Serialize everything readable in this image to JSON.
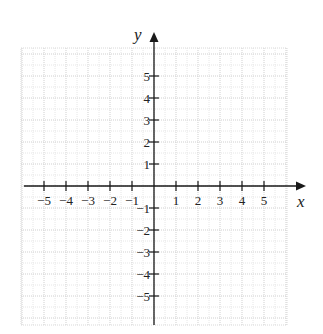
{
  "chart_data": {
    "type": "scatter",
    "title": "",
    "xlabel": "x",
    "ylabel": "y",
    "xlim": [
      -6,
      6
    ],
    "ylim": [
      -6,
      6
    ],
    "grid": true,
    "grid_style": "dotted",
    "x_ticks": [
      -5,
      -4,
      -3,
      -2,
      -1,
      1,
      2,
      3,
      4,
      5
    ],
    "y_ticks": [
      5,
      4,
      3,
      2,
      1,
      -1,
      -2,
      -3,
      -4,
      -5
    ],
    "x_tick_labels": [
      "−5",
      "−4",
      "−3",
      "−2",
      "−1",
      "1",
      "2",
      "3",
      "4",
      "5"
    ],
    "y_tick_labels": [
      "5",
      "4",
      "3",
      "2",
      "1",
      "−1",
      "−2",
      "−3",
      "−4",
      "−5"
    ],
    "series": [],
    "legend": null
  },
  "colors": {
    "axis": "#1a1a1a",
    "grid": "#d0d0d0",
    "text": "#222222"
  }
}
